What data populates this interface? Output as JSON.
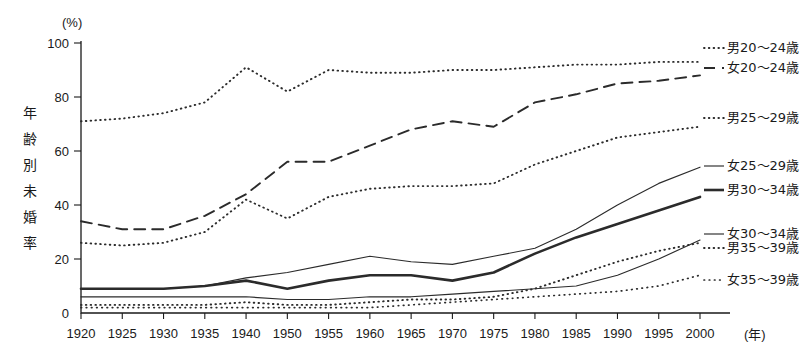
{
  "chart_data": {
    "type": "line",
    "title": "",
    "xlabel": "年",
    "ylabel": "年齢別未婚率",
    "yunit": "(%)",
    "xunit": "(年)",
    "xlim": [
      1920,
      2000
    ],
    "ylim": [
      0,
      100
    ],
    "grid": false,
    "legend_position": "right",
    "x": [
      1920,
      1925,
      1930,
      1935,
      1940,
      1950,
      1955,
      1960,
      1965,
      1970,
      1975,
      1980,
      1985,
      1990,
      1995,
      2000
    ],
    "xtick_labels": [
      "1920",
      "1925",
      "1930",
      "1935",
      "1940",
      "1950",
      "1955",
      "1960",
      "1965",
      "1970",
      "1975",
      "1980",
      "1985",
      "1990",
      "1995",
      "2000"
    ],
    "ytick_labels": [
      "0",
      "20",
      "40",
      "60",
      "80",
      "100"
    ],
    "ytick_values": [
      0,
      20,
      40,
      60,
      80,
      100
    ],
    "series": [
      {
        "name": "男20～24歳",
        "style": "dotted",
        "values": [
          71,
          72,
          74,
          78,
          91,
          82,
          90,
          89,
          89,
          90,
          90,
          91,
          92,
          92,
          93,
          93
        ]
      },
      {
        "name": "女20～24歳",
        "style": "dashed",
        "values": [
          34,
          31,
          31,
          36,
          44,
          56,
          56,
          62,
          68,
          71,
          69,
          78,
          81,
          85,
          86,
          88
        ]
      },
      {
        "name": "男25～29歳",
        "style": "dotted",
        "values": [
          26,
          25,
          26,
          30,
          42,
          35,
          43,
          46,
          47,
          47,
          48,
          55,
          60,
          65,
          67,
          69
        ]
      },
      {
        "name": "女25～29歳",
        "style": "thin-solid",
        "values": [
          9,
          9,
          9,
          10,
          13,
          15,
          18,
          21,
          19,
          18,
          21,
          24,
          31,
          40,
          48,
          54
        ]
      },
      {
        "name": "男30～34歳",
        "style": "thick-solid",
        "values": [
          9,
          9,
          9,
          10,
          12,
          9,
          12,
          14,
          14,
          12,
          15,
          22,
          28,
          33,
          38,
          43
        ]
      },
      {
        "name": "女30～34歳",
        "style": "thin-solid",
        "values": [
          6,
          6,
          6,
          6,
          6,
          5,
          5,
          6,
          6,
          7,
          8,
          9,
          10,
          14,
          20,
          27
        ]
      },
      {
        "name": "男35～39歳",
        "style": "dotted",
        "values": [
          3,
          3,
          3,
          3,
          4,
          3,
          3,
          4,
          5,
          5,
          6,
          9,
          14,
          19,
          23,
          26
        ]
      },
      {
        "name": "女35～39歳",
        "style": "dotted-fine",
        "values": [
          2,
          2,
          2,
          2,
          2,
          2,
          2,
          2,
          3,
          4,
          5,
          6,
          7,
          8,
          10,
          14
        ]
      }
    ]
  },
  "legend": {
    "entries": [
      {
        "label": "男20～24歳"
      },
      {
        "label": "女20～24歳"
      },
      {
        "label": "男25～29歳"
      },
      {
        "label": "女25～29歳"
      },
      {
        "label": "男30～34歳"
      },
      {
        "label": "女30～34歳"
      },
      {
        "label": "男35～39歳"
      },
      {
        "label": "女35～39歳"
      }
    ]
  },
  "axes": {
    "y_unit": "(%)",
    "y_title": "年齢別未婚率",
    "x_unit": "(年)"
  }
}
